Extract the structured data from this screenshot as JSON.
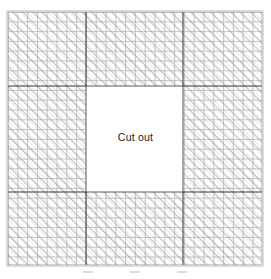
{
  "figure": {
    "type": "finite-element-mesh",
    "label_cutout": "Cut out",
    "colors": {
      "mesh_line": "#9a9a9a",
      "hatch_line": "#b4b4b4",
      "partition_line": "#2b2b2b",
      "outer_border": "#d0d0d0",
      "cutout_border": "#4a4a4a",
      "background": "#ffffff",
      "text": "#1a1a1a"
    },
    "geometry": {
      "plate": {
        "x": 8,
        "y": 12,
        "width": 254,
        "height": 253
      },
      "cutout": {
        "x": 86,
        "y": 86,
        "width": 97,
        "height": 106
      },
      "partitions_vertical_x": [
        86,
        183
      ],
      "partitions_horizontal_y": [
        86,
        192
      ],
      "cell_size": 9.8,
      "columns": 26,
      "rows": 26
    },
    "support_marks": {
      "count": 3,
      "x_positions": [
        88,
        135,
        182
      ],
      "y": 272
    }
  }
}
